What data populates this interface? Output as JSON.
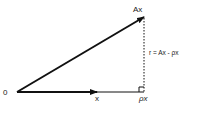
{
  "diagram": {
    "type": "vector-projection",
    "labels": {
      "origin": "0",
      "x_vector": "x",
      "ax_vector": "Ax",
      "projection": "ρx",
      "residual": "r = Ax - ρx"
    },
    "colors": {
      "stroke": "#111111",
      "text": "#222222",
      "background": "#ffffff"
    }
  }
}
